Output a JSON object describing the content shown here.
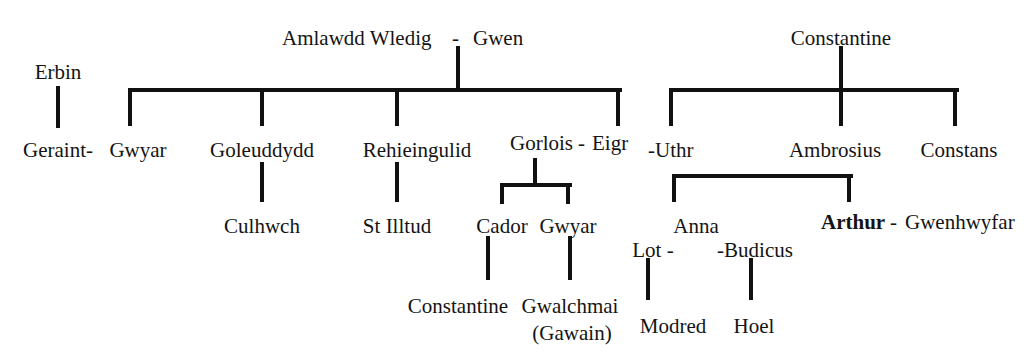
{
  "type": "genealogy-tree",
  "people": {
    "erbin": {
      "label": "Erbin",
      "x": 58,
      "y": 62,
      "align": "center",
      "bold": false
    },
    "amlawdd": {
      "label": "Amlawdd Wledig",
      "x": 282,
      "y": 28,
      "align": "left",
      "bold": false
    },
    "dash1": {
      "label": "-",
      "x": 452,
      "y": 28,
      "align": "left",
      "bold": false
    },
    "gwen": {
      "label": "Gwen",
      "x": 473,
      "y": 28,
      "align": "left",
      "bold": false
    },
    "constantine1": {
      "label": "Constantine",
      "x": 841,
      "y": 28,
      "align": "center",
      "bold": false
    },
    "geraint": {
      "label": "Geraint-",
      "x": 58,
      "y": 140,
      "align": "center",
      "bold": false
    },
    "gwyar1": {
      "label": "Gwyar",
      "x": 138,
      "y": 140,
      "align": "center",
      "bold": false
    },
    "goleuddydd": {
      "label": "Goleuddydd",
      "x": 262,
      "y": 140,
      "align": "center",
      "bold": false
    },
    "rehieingulid": {
      "label": "Rehieingulid",
      "x": 417,
      "y": 140,
      "align": "center",
      "bold": false
    },
    "gorlois": {
      "label": "Gorlois",
      "x": 510,
      "y": 133,
      "align": "left",
      "bold": false
    },
    "dash2": {
      "label": "-",
      "x": 578,
      "y": 133,
      "align": "left",
      "bold": false
    },
    "eigr": {
      "label": "Eigr",
      "x": 592,
      "y": 133,
      "align": "left",
      "bold": false
    },
    "uthr": {
      "label": "-Uthr",
      "x": 648,
      "y": 140,
      "align": "left",
      "bold": false
    },
    "ambrosius": {
      "label": "Ambrosius",
      "x": 835,
      "y": 140,
      "align": "center",
      "bold": false
    },
    "constans": {
      "label": "Constans",
      "x": 959,
      "y": 140,
      "align": "center",
      "bold": false
    },
    "culhwch": {
      "label": "Culhwch",
      "x": 262,
      "y": 216,
      "align": "center",
      "bold": false
    },
    "stilltud": {
      "label": "St Illtud",
      "x": 397,
      "y": 216,
      "align": "center",
      "bold": false
    },
    "cador": {
      "label": "Cador",
      "x": 502,
      "y": 216,
      "align": "center",
      "bold": false
    },
    "gwyar2": {
      "label": "Gwyar",
      "x": 568,
      "y": 216,
      "align": "center",
      "bold": false
    },
    "anna": {
      "label": "Anna",
      "x": 696,
      "y": 216,
      "align": "center",
      "bold": false
    },
    "arthur": {
      "label": "Arthur",
      "x": 821,
      "y": 212,
      "align": "left",
      "bold": true
    },
    "dash3": {
      "label": "-",
      "x": 890,
      "y": 212,
      "align": "left",
      "bold": false
    },
    "gwenhwyfar": {
      "label": "Gwenhwyfar",
      "x": 905,
      "y": 212,
      "align": "left",
      "bold": false
    },
    "lot": {
      "label": "Lot -",
      "x": 653,
      "y": 240,
      "align": "center",
      "bold": false
    },
    "budicus": {
      "label": "-Budicus",
      "x": 755,
      "y": 240,
      "align": "center",
      "bold": false
    },
    "constantine2": {
      "label": "Constantine",
      "x": 458,
      "y": 296,
      "align": "center",
      "bold": false
    },
    "gwalchmai": {
      "label": "Gwalchmai",
      "x": 570,
      "y": 296,
      "align": "center",
      "bold": false
    },
    "gawain": {
      "label": "(Gawain)",
      "x": 572,
      "y": 323,
      "align": "center",
      "bold": false
    },
    "modred": {
      "label": "Modred",
      "x": 673,
      "y": 316,
      "align": "center",
      "bold": false
    },
    "hoel": {
      "label": "Hoel",
      "x": 754,
      "y": 316,
      "align": "center",
      "bold": false
    }
  },
  "connectors": {
    "vertical": [
      {
        "name": "erbin-to-geraint",
        "x": 58,
        "y": 86,
        "h": 42
      },
      {
        "name": "amlawdd-gwen-stem",
        "x": 458,
        "y": 46,
        "h": 42
      },
      {
        "name": "sibling-drop-gwyar",
        "x": 130,
        "y": 88,
        "h": 38
      },
      {
        "name": "sibling-drop-goleuddydd",
        "x": 262,
        "y": 88,
        "h": 38
      },
      {
        "name": "sibling-drop-rehieingulid",
        "x": 397,
        "y": 88,
        "h": 38
      },
      {
        "name": "sibling-drop-gorlois",
        "x": 618,
        "y": 88,
        "h": 38
      },
      {
        "name": "constantine-stem",
        "x": 841,
        "y": 46,
        "h": 42
      },
      {
        "name": "sibling-drop-uthr",
        "x": 671,
        "y": 88,
        "h": 38
      },
      {
        "name": "sibling-drop-ambrosius",
        "x": 841,
        "y": 88,
        "h": 38
      },
      {
        "name": "sibling-drop-constans",
        "x": 955,
        "y": 88,
        "h": 38
      },
      {
        "name": "goleuddydd-to-culhwch",
        "x": 262,
        "y": 162,
        "h": 40
      },
      {
        "name": "rehieingulid-to-stilltud",
        "x": 397,
        "y": 162,
        "h": 40
      },
      {
        "name": "gorlois-eigr-stem",
        "x": 535,
        "y": 158,
        "h": 26
      },
      {
        "name": "child-drop-cador",
        "x": 502,
        "y": 183,
        "h": 21
      },
      {
        "name": "child-drop-gwyar2",
        "x": 568,
        "y": 183,
        "h": 21
      },
      {
        "name": "cador-to-constantine2",
        "x": 488,
        "y": 236,
        "h": 44
      },
      {
        "name": "gwyar2-to-gwalchmai",
        "x": 570,
        "y": 236,
        "h": 44
      },
      {
        "name": "child-drop-anna",
        "x": 674,
        "y": 174,
        "h": 28
      },
      {
        "name": "child-drop-arthur",
        "x": 849,
        "y": 174,
        "h": 28
      },
      {
        "name": "lot-to-modred",
        "x": 648,
        "y": 258,
        "h": 42
      },
      {
        "name": "budicus-to-hoel",
        "x": 751,
        "y": 258,
        "h": 42
      }
    ],
    "horizontal": [
      {
        "name": "amlawdd-gwen-sibling-bar",
        "x": 130,
        "y": 88,
        "w": 492
      },
      {
        "name": "constantine-sibling-bar",
        "x": 669,
        "y": 88,
        "w": 290
      },
      {
        "name": "gorlois-eigr-children-bar",
        "x": 502,
        "y": 183,
        "w": 70
      },
      {
        "name": "uthr-eigr-children-bar",
        "x": 674,
        "y": 174,
        "w": 179
      }
    ]
  },
  "colors": {
    "line": "#111111",
    "text": "#141414",
    "background": "#ffffff"
  }
}
